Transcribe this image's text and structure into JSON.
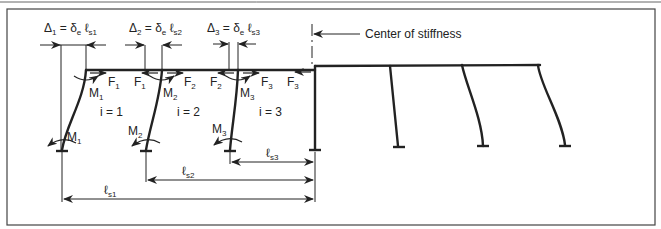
{
  "figure": {
    "center_label": "Center of stiffness",
    "displacements": [
      {
        "delta": "Δ",
        "index": "1",
        "eq": "= δ",
        "e": "e",
        "l": "ℓ",
        "ls": "s1"
      },
      {
        "delta": "Δ",
        "index": "2",
        "eq": "= δ",
        "e": "e",
        "l": "ℓ",
        "ls": "s2"
      },
      {
        "delta": "Δ",
        "index": "3",
        "eq": "= δ",
        "e": "e",
        "l": "ℓ",
        "ls": "s3"
      }
    ],
    "forces": [
      {
        "name": "F",
        "sub": "1"
      },
      {
        "name": "F",
        "sub": "1"
      },
      {
        "name": "F",
        "sub": "2"
      },
      {
        "name": "F",
        "sub": "2"
      },
      {
        "name": "F",
        "sub": "3"
      },
      {
        "name": "F",
        "sub": "3"
      }
    ],
    "top_moments": [
      {
        "name": "M",
        "sub": "1"
      },
      {
        "name": "M",
        "sub": "2"
      },
      {
        "name": "M",
        "sub": "3"
      }
    ],
    "base_moments": [
      {
        "name": "M",
        "sub": "1"
      },
      {
        "name": "M",
        "sub": "2"
      },
      {
        "name": "M",
        "sub": "3"
      }
    ],
    "bays": [
      "i = 1",
      "i = 2",
      "i = 3"
    ],
    "distances": [
      {
        "l": "ℓ",
        "sub": "s1"
      },
      {
        "l": "ℓ",
        "sub": "s2"
      },
      {
        "l": "ℓ",
        "sub": "s3"
      }
    ]
  }
}
